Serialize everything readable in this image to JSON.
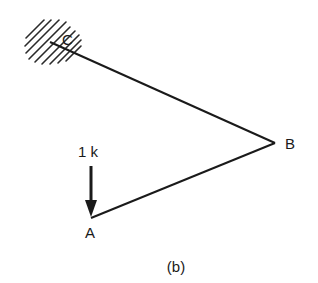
{
  "figure": {
    "caption": "(b)",
    "nodes": {
      "C": {
        "label": "C",
        "x": 50,
        "y": 42,
        "support": "fixed"
      },
      "B": {
        "label": "B",
        "x": 275,
        "y": 143
      },
      "A": {
        "label": "A",
        "x": 91,
        "y": 218
      }
    },
    "members": [
      {
        "from": "C",
        "to": "B"
      },
      {
        "from": "B",
        "to": "A"
      }
    ],
    "load": {
      "label": "1 k",
      "node": "A",
      "direction": "down"
    },
    "colors": {
      "line": "#1a1a1a",
      "background": "#ffffff"
    }
  }
}
